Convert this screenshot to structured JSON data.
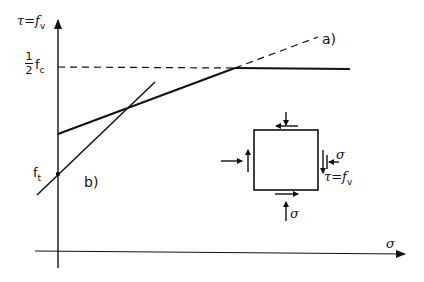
{
  "diagram": {
    "type": "shear-stress failure criterion diagram",
    "y_axis": {
      "label": "τ=f",
      "label_sub": "v"
    },
    "x_axis": {
      "label": "σ"
    },
    "y_ticks": {
      "half_fc": {
        "num": "1",
        "den": "2",
        "text": "f",
        "sub": "c"
      },
      "ft": {
        "text": "f",
        "sub": "t"
      }
    },
    "lines": {
      "a": {
        "label": "a)"
      },
      "b": {
        "label": "b)"
      }
    },
    "element": {
      "sigma_right": "σ",
      "sigma_bottom": "σ",
      "tau_label": "τ=f",
      "tau_sub": "v"
    },
    "colors": {
      "ink": "#111111",
      "background": "#ffffff"
    }
  }
}
